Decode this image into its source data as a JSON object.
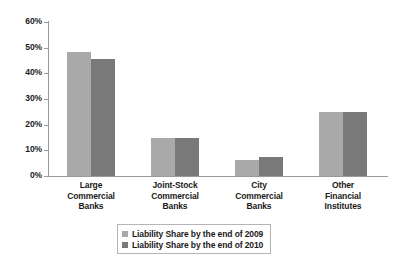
{
  "chart_data": {
    "type": "bar",
    "title": "",
    "xlabel": "",
    "ylabel": "",
    "ylim": [
      0,
      60
    ],
    "ytick_labels": [
      "0%",
      "10%",
      "20%",
      "30%",
      "40%",
      "50%",
      "60%"
    ],
    "ytick_values": [
      0,
      10,
      20,
      30,
      40,
      50,
      60
    ],
    "grid": false,
    "legend_position": "bottom-center",
    "categories": [
      "Large Commercial Banks",
      "Joint-Stock Commercial Banks",
      "City Commercial Banks",
      "Other Financial Institutes"
    ],
    "category_lines": [
      [
        "Large",
        "Commercial",
        "Banks"
      ],
      [
        "Joint-Stock",
        "Commercial",
        "Banks"
      ],
      [
        "City",
        "Commercial",
        "Banks"
      ],
      [
        "Other",
        "Financial",
        "Institutes"
      ]
    ],
    "series": [
      {
        "name": "Liability Share by the end of 2009",
        "color": "#a9a9a9",
        "values": [
          48.3,
          14.8,
          6.1,
          24.8
        ]
      },
      {
        "name": "Liability Share by the end of 2010",
        "color": "#797979",
        "values": [
          45.6,
          15.0,
          7.6,
          24.8
        ]
      }
    ]
  },
  "legend": {
    "items": [
      {
        "label": "Liability Share by the end of 2009",
        "color": "#a9a9a9"
      },
      {
        "label": "Liability Share by the end of 2010",
        "color": "#797979"
      }
    ]
  },
  "axis": {
    "line_color": "#9a9a9a"
  }
}
